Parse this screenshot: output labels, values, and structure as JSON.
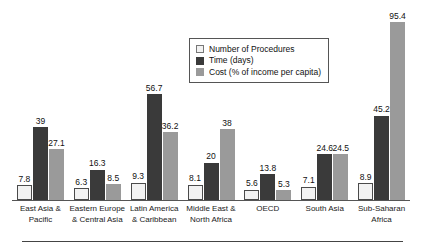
{
  "chart_data": {
    "type": "bar",
    "title": "",
    "xlabel": "",
    "ylabel": "",
    "grid": false,
    "legend_position": "top-center-right",
    "ylim": [
      0,
      100
    ],
    "categories": [
      "East Asia & Pacific",
      "Eastern Europe & Central Asia",
      "Latin America & Caribbean",
      "Middle East & North Africa",
      "OECD",
      "South Asia",
      "Sub-Saharan Africa"
    ],
    "category_lines": [
      [
        "East Asia &",
        "Pacific"
      ],
      [
        "Eastern Europe",
        "& Central Asia"
      ],
      [
        "Latin America",
        "& Caribbean"
      ],
      [
        "Middle East &",
        "North Africa"
      ],
      [
        "OECD",
        ""
      ],
      [
        "South Asia",
        ""
      ],
      [
        "Sub-Saharan",
        "Africa"
      ]
    ],
    "series": [
      {
        "name": "Number of Procedures",
        "color": "#f2f2f2",
        "values": [
          7.8,
          6.3,
          9.3,
          8.1,
          5.6,
          7.1,
          8.9
        ],
        "labels": [
          "7.8",
          "6.3",
          "9.3",
          "8.1",
          "5.6",
          "7.1",
          "8.9"
        ]
      },
      {
        "name": "Time (days)",
        "color": "#3a3a3a",
        "values": [
          39,
          16.3,
          56.7,
          20,
          13.8,
          24.6,
          45.2
        ],
        "labels": [
          "39",
          "16.3",
          "56.7",
          "20",
          "13.8",
          "24.6",
          "45.2"
        ]
      },
      {
        "name": "Cost (% of income per capita)",
        "color": "#9a9a9a",
        "values": [
          27.1,
          8.5,
          36.2,
          38,
          5.3,
          24.5,
          95.4
        ],
        "labels": [
          "27.1",
          "8.5",
          "36.2",
          "38",
          "5.3",
          "24.5",
          "95.4"
        ]
      }
    ]
  },
  "legend": {
    "items": [
      {
        "label": "Number of Procedures"
      },
      {
        "label": "Time (days)"
      },
      {
        "label": "Cost (% of income per capita)"
      }
    ]
  }
}
